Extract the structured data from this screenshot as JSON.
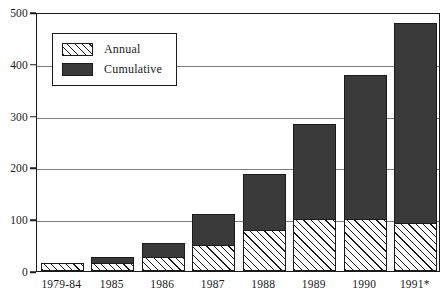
{
  "chart_data": {
    "type": "bar",
    "title": "",
    "subtitle": "",
    "xlabel": "",
    "ylabel": "",
    "stacked": true,
    "grid": true,
    "legend_position": "inside-top-left",
    "ylim": [
      0,
      500
    ],
    "yticks": [
      0,
      100,
      200,
      300,
      400,
      500
    ],
    "ytick_labels": [
      "0",
      "100",
      "200",
      "300",
      "400",
      "500"
    ],
    "categories": [
      "1979-84",
      "1985",
      "1986",
      "1987",
      "1988",
      "1989",
      "1990",
      "1991*"
    ],
    "series": [
      {
        "name": "Annual",
        "fill": "hatched",
        "values": [
          15,
          15,
          28,
          50,
          79,
          100,
          100,
          93
        ]
      },
      {
        "name": "Cumulative",
        "fill": "solid-dark",
        "values": [
          15,
          27,
          54,
          110,
          187,
          283,
          378,
          478
        ]
      }
    ]
  },
  "legend": {
    "items": [
      {
        "label": "Annual",
        "swatch": "hatched-swatch"
      },
      {
        "label": "Cumulative",
        "swatch": "dark-solid-swatch"
      }
    ]
  },
  "axes": {
    "y": {
      "ticks": [
        "500",
        "400",
        "300",
        "200",
        "100",
        "0"
      ],
      "values": [
        500,
        400,
        300,
        200,
        100,
        0
      ]
    },
    "x": {
      "ticks": [
        "1979-84",
        "1985",
        "1986",
        "1987",
        "1988",
        "1989",
        "1990",
        "1991*"
      ]
    }
  },
  "colors": {
    "cumulative_fill": "#3a3a3a",
    "annual_hatch": "#1a1a1a",
    "annual_background": "#ffffff",
    "axis": "#1a1a1a",
    "gridline": "#7d7d7d",
    "page_background": "#ffffff"
  }
}
